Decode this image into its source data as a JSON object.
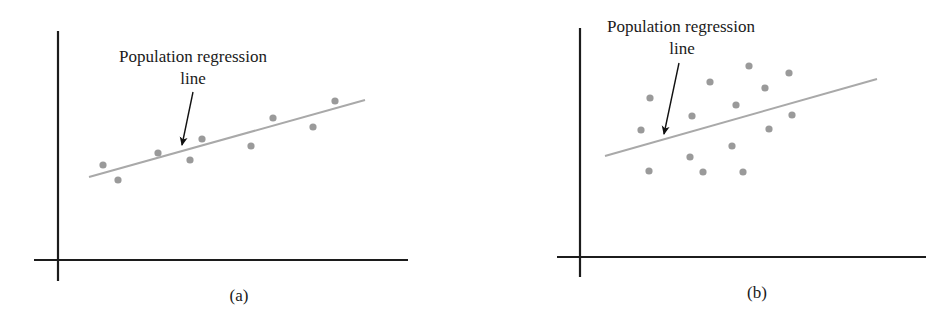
{
  "figure": {
    "panels": [
      {
        "id": "a",
        "caption": "(a)",
        "annotation_line1": "Population regression",
        "annotation_line2": "line",
        "layout": {
          "y_axis": {
            "x": 58,
            "y1": 31,
            "y2": 281
          },
          "x_axis": {
            "y": 260,
            "x1": 34,
            "x2": 408
          },
          "regression_line": {
            "x1": 89,
            "y1": 177,
            "x2": 365,
            "y2": 100
          },
          "arrow": {
            "x1": 193,
            "y1": 92,
            "x2": 182,
            "y2": 145
          },
          "label_line1": {
            "x": 193,
            "y": 62
          },
          "label_line2": {
            "x": 193,
            "y": 84
          },
          "caption_pos": {
            "x": 239,
            "y": 301
          }
        },
        "points": [
          [
            103,
            165
          ],
          [
            118,
            180
          ],
          [
            158,
            153
          ],
          [
            190,
            160
          ],
          [
            202,
            139
          ],
          [
            251,
            146
          ],
          [
            273,
            118
          ],
          [
            313,
            127
          ],
          [
            335,
            101
          ]
        ]
      },
      {
        "id": "b",
        "caption": "(b)",
        "annotation_line1": "Population regression",
        "annotation_line2": "line",
        "layout": {
          "y_axis": {
            "x": 580,
            "y1": 28,
            "y2": 277
          },
          "x_axis": {
            "y": 257,
            "x1": 557,
            "x2": 926
          },
          "regression_line": {
            "x1": 605,
            "y1": 156,
            "x2": 877,
            "y2": 79
          },
          "arrow": {
            "x1": 679,
            "y1": 63,
            "x2": 664,
            "y2": 134
          },
          "label_line1": {
            "x": 681,
            "y": 32
          },
          "label_line2": {
            "x": 682,
            "y": 54
          },
          "caption_pos": {
            "x": 757,
            "y": 298
          }
        },
        "points": [
          [
            650,
            98
          ],
          [
            710,
            82
          ],
          [
            641,
            130
          ],
          [
            692,
            116
          ],
          [
            736,
            105
          ],
          [
            732,
            146
          ],
          [
            690,
            157
          ],
          [
            649,
            171
          ],
          [
            703,
            172
          ],
          [
            749,
            66
          ],
          [
            789,
            73
          ],
          [
            765,
            88
          ],
          [
            792,
            115
          ],
          [
            769,
            129
          ],
          [
            743,
            172
          ]
        ]
      }
    ],
    "colors": {
      "axis": "#1c1c1c",
      "regression_line": "#a9a9a9",
      "points": "#9a9a9a",
      "arrow": "#111111",
      "text": "#1a1a1a"
    }
  },
  "chart_data": [
    {
      "type": "scatter",
      "title": "(a)",
      "annotation": "Population regression line",
      "description": "Points tightly clustered around an upward-sloping population regression line",
      "xlabel": "",
      "ylabel": "",
      "grid": false,
      "points_pixel": [
        [
          103,
          165
        ],
        [
          118,
          180
        ],
        [
          158,
          153
        ],
        [
          190,
          160
        ],
        [
          202,
          139
        ],
        [
          251,
          146
        ],
        [
          273,
          118
        ],
        [
          313,
          127
        ],
        [
          335,
          101
        ]
      ],
      "regression_line_pixel": [
        [
          89,
          177
        ],
        [
          365,
          100
        ]
      ]
    },
    {
      "type": "scatter",
      "title": "(b)",
      "annotation": "Population regression line",
      "description": "Points widely scattered around an upward-sloping population regression line",
      "xlabel": "",
      "ylabel": "",
      "grid": false,
      "points_pixel": [
        [
          650,
          98
        ],
        [
          710,
          82
        ],
        [
          641,
          130
        ],
        [
          692,
          116
        ],
        [
          736,
          105
        ],
        [
          732,
          146
        ],
        [
          690,
          157
        ],
        [
          649,
          171
        ],
        [
          703,
          172
        ],
        [
          749,
          66
        ],
        [
          789,
          73
        ],
        [
          765,
          88
        ],
        [
          792,
          115
        ],
        [
          769,
          129
        ],
        [
          743,
          172
        ]
      ],
      "regression_line_pixel": [
        [
          605,
          156
        ],
        [
          877,
          79
        ]
      ]
    }
  ]
}
